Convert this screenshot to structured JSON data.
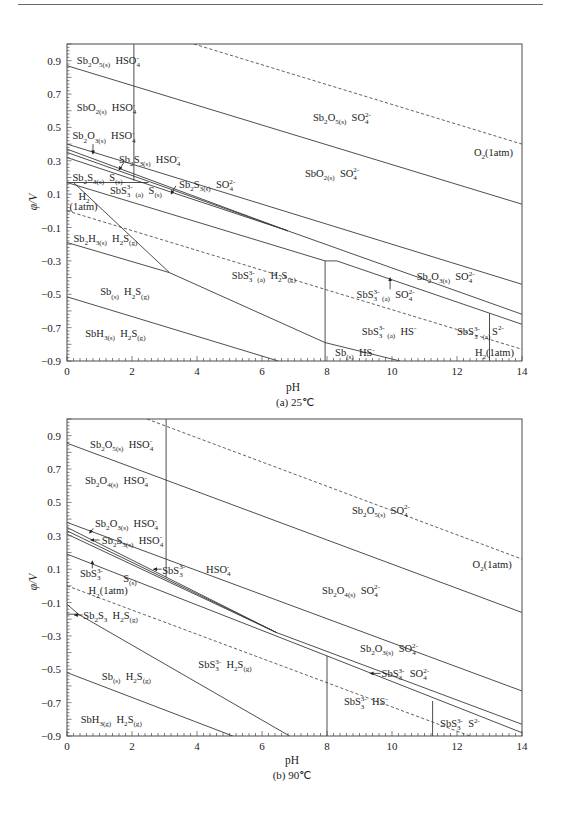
{
  "page": {
    "header_rule": "top page rule"
  },
  "chart_data": [
    {
      "type": "line",
      "title": "(a)  25℃",
      "xlabel": "pH",
      "ylabel": "φ/V",
      "xlim": [
        0,
        14
      ],
      "ylim": [
        -0.9,
        1.0
      ],
      "grid": false,
      "legend": "none (in-plot region labels)",
      "xticks": [
        0,
        2,
        4,
        6,
        8,
        10,
        12,
        14
      ],
      "xtick_labels": [
        "0",
        "2",
        "4",
        "6",
        "8",
        "10",
        "12",
        "14"
      ],
      "yticks": [
        0.9,
        0.7,
        0.5,
        0.3,
        0.1,
        -0.1,
        -0.3,
        -0.5,
        -0.7,
        -0.9
      ],
      "ytick_labels": [
        "0.9",
        "0.7",
        "0.5",
        "0.3",
        "0.1",
        "−0.1",
        "−0.3",
        "−0.5",
        "−0.7",
        "−0.9"
      ],
      "x_minor_step": 0.2,
      "y_minor_step": 0.02,
      "y_major_step": 0.1,
      "series": [
        {
          "name": "O2(1atm) equilibrium",
          "style": "dashed",
          "points": [
            [
              3.9,
              1.0
            ],
            [
              14,
              0.4
            ]
          ]
        },
        {
          "name": "H2(1atm) equilibrium",
          "style": "dashed",
          "points": [
            [
              0,
              0.0
            ],
            [
              14,
              -0.83
            ]
          ]
        },
        {
          "name": "Sb2O5 / SbO2 boundary",
          "style": "solid",
          "points": [
            [
              0,
              0.87
            ],
            [
              14,
              0.04
            ]
          ]
        },
        {
          "name": "HSO4- / SO4 2- boundary",
          "style": "solid",
          "points": [
            [
              2.06,
              1.0
            ],
            [
              2.06,
              0.18
            ]
          ]
        },
        {
          "name": "Sb2S3 / S horizontal",
          "style": "solid",
          "points": [
            [
              0,
              0.17
            ],
            [
              2.5,
              0.17
            ]
          ]
        },
        {
          "name": "SbO2 / Sb2O3 boundary",
          "style": "solid",
          "points": [
            [
              0,
              0.4
            ],
            [
              14,
              -0.44
            ]
          ]
        },
        {
          "name": "boundary b1",
          "style": "solid",
          "points": [
            [
              0,
              0.37
            ],
            [
              6.8,
              -0.12
            ],
            [
              14,
              -0.62
            ]
          ]
        },
        {
          "name": "boundary b2",
          "style": "solid",
          "points": [
            [
              0,
              0.35
            ],
            [
              6.8,
              -0.12
            ]
          ]
        },
        {
          "name": "boundary b3",
          "style": "solid",
          "points": [
            [
              0,
              0.32
            ],
            [
              6.8,
              -0.12
            ]
          ]
        },
        {
          "name": "boundary b4",
          "style": "solid",
          "points": [
            [
              0,
              0.17
            ],
            [
              7.94,
              -0.3
            ],
            [
              8.3,
              -0.3
            ],
            [
              14,
              -0.68
            ]
          ]
        },
        {
          "name": "H2S / HS- boundary (pH 8)",
          "style": "solid",
          "points": [
            [
              7.94,
              -0.3
            ],
            [
              7.94,
              -0.9
            ]
          ]
        },
        {
          "name": "HS- / S2- boundary (pH 13)",
          "style": "solid",
          "points": [
            [
              13,
              -0.615
            ],
            [
              13,
              -0.9
            ]
          ]
        },
        {
          "name": "Sb2S3 / SbS3 3- steep boundary",
          "style": "solid",
          "points": [
            [
              0.2,
              0.17
            ],
            [
              3.15,
              -0.37
            ]
          ]
        },
        {
          "name": "Sb2S3 / Sb boundary",
          "style": "solid",
          "points": [
            [
              0,
              -0.19
            ],
            [
              3.15,
              -0.37
            ],
            [
              7.94,
              -0.79
            ],
            [
              10.25,
              -0.9
            ]
          ]
        },
        {
          "name": "Sb / SbH3 boundary",
          "style": "solid",
          "points": [
            [
              0,
              -0.515
            ],
            [
              6.5,
              -0.9
            ]
          ]
        }
      ],
      "region_labels": [
        {
          "text": "Sb_{2}O_{5(s)}  HSO_{4}^{-}",
          "x": 0.3,
          "y": 0.9
        },
        {
          "text": "SbO_{2(s)}  HSO_{4}^{-}",
          "x": 0.3,
          "y": 0.62
        },
        {
          "text": "Sb_{2}O_{3(s)}  HSO_{4}^{-}",
          "x": 0.17,
          "y": 0.45
        },
        {
          "text": "Sb_{2}S_{3(s)}  HSO_{4}^{-}",
          "x": 1.6,
          "y": 0.31
        },
        {
          "text": "Sb_{2}S_{3(s)}  S_{(s)}",
          "x": 0.17,
          "y": 0.2
        },
        {
          "text": "SbS_{3}^{3-} _{(a)}  S_{(s)}",
          "x": 1.32,
          "y": 0.125
        },
        {
          "text": "Sb_{2}S_{3(s)}  SO_{4}^{2-}",
          "x": 3.45,
          "y": 0.16
        },
        {
          "text": "H_{2}",
          "x": 0.35,
          "y": 0.085
        },
        {
          "text": "(1atm)",
          "x": 0.08,
          "y": 0.025
        },
        {
          "text": "Sb_{2}H_{3(s)}  H_{2}S_{(g)}",
          "x": 0.2,
          "y": -0.165
        },
        {
          "text": "Sb_{(s)}  H_{2}S_{(g)}",
          "x": 1.02,
          "y": -0.485
        },
        {
          "text": "SbH_{3(s)}  H_{2}S_{(g)}",
          "x": 0.56,
          "y": -0.735
        },
        {
          "text": "SbS_{3}^{3-} _{(a)}  H_{2}S_{(g)}",
          "x": 5.07,
          "y": -0.385
        },
        {
          "text": "Sb_{2}O_{5(s)}  SO_{4}^{2-}",
          "x": 7.57,
          "y": 0.56
        },
        {
          "text": "SbO_{2(s)}  SO_{4}^{2-}",
          "x": 7.32,
          "y": 0.227
        },
        {
          "text": "O_{2}(1atm)",
          "x": 12.52,
          "y": 0.353
        },
        {
          "text": "Sb_{2}O_{3(s)}  SO_{4}^{2-}",
          "x": 10.76,
          "y": -0.395
        },
        {
          "text": "SbS_{3}^{3-} _{(a)}  SO_{4}^{2-}",
          "x": 8.91,
          "y": -0.5
        },
        {
          "text": "SbS_{3}^{3-} _{(a)}  HS^{-}",
          "x": 9.07,
          "y": -0.72
        },
        {
          "text": "SbS_{3}^{3-} _{(a)}",
          "x": 12.0,
          "y": -0.725
        },
        {
          "text": "S^{2-}",
          "x": 13.08,
          "y": -0.72
        },
        {
          "text": "Sb_{(s)}  HS^{-}",
          "x": 8.25,
          "y": -0.85
        },
        {
          "text": "H_{2}(1atm)",
          "x": 12.55,
          "y": -0.85
        }
      ],
      "arrows": [
        {
          "from": [
            0.8,
            0.4
          ],
          "to": [
            0.8,
            0.34
          ]
        },
        {
          "from": [
            1.75,
            0.29
          ],
          "to": [
            1.6,
            0.245
          ]
        },
        {
          "from": [
            3.35,
            0.15
          ],
          "to": [
            3.2,
            0.1
          ]
        },
        {
          "from": [
            9.94,
            -0.47
          ],
          "to": [
            9.94,
            -0.4
          ]
        }
      ]
    },
    {
      "type": "line",
      "title": "(b)  90℃",
      "xlabel": "pH",
      "ylabel": "φ/V",
      "xlim": [
        0,
        14
      ],
      "ylim": [
        -0.9,
        1.0
      ],
      "grid": false,
      "legend": "none (in-plot region labels)",
      "xticks": [
        0,
        2,
        4,
        6,
        8,
        10,
        12,
        14
      ],
      "xtick_labels": [
        "0",
        "2",
        "4",
        "6",
        "8",
        "10",
        "12",
        "14"
      ],
      "yticks": [
        0.9,
        0.7,
        0.5,
        0.3,
        0.1,
        -0.1,
        -0.3,
        -0.5,
        -0.7,
        -0.9
      ],
      "ytick_labels": [
        "0.9",
        "0.7",
        "0.5",
        "0.3",
        "0.1",
        "−0.1",
        "−0.3",
        "−0.5",
        "−0.7",
        "−0.9"
      ],
      "x_minor_step": 0.2,
      "y_minor_step": 0.02,
      "y_major_step": 0.1,
      "series": [
        {
          "name": "O2(1atm) equilibrium",
          "style": "dashed",
          "points": [
            [
              2.46,
              1.0
            ],
            [
              14,
              0.16
            ]
          ]
        },
        {
          "name": "H2(1atm) equilibrium",
          "style": "dashed",
          "points": [
            [
              0,
              0.0
            ],
            [
              12.4,
              -0.9
            ]
          ]
        },
        {
          "name": "Sb2O5 / Sb2O4 boundary",
          "style": "solid",
          "points": [
            [
              0,
              0.855
            ],
            [
              14,
              -0.16
            ]
          ]
        },
        {
          "name": "HSO4- / SO4 2- boundary",
          "style": "solid",
          "points": [
            [
              3.05,
              1.0
            ],
            [
              3.05,
              0.05
            ]
          ]
        },
        {
          "name": "Sb2O4 / Sb2O3 boundary",
          "style": "solid",
          "points": [
            [
              0,
              0.38
            ],
            [
              14,
              -0.63
            ]
          ]
        },
        {
          "name": "boundary c1",
          "style": "solid",
          "points": [
            [
              0,
              0.35
            ],
            [
              6.45,
              -0.28
            ],
            [
              14,
              -0.83
            ]
          ]
        },
        {
          "name": "boundary c2",
          "style": "solid",
          "points": [
            [
              0,
              0.33
            ],
            [
              6.45,
              -0.28
            ]
          ]
        },
        {
          "name": "boundary c3",
          "style": "solid",
          "points": [
            [
              0,
              0.31
            ],
            [
              6.45,
              -0.28
            ]
          ]
        },
        {
          "name": "boundary c4",
          "style": "solid",
          "points": [
            [
              0,
              0.19
            ],
            [
              8,
              -0.42
            ],
            [
              14,
              -0.88
            ]
          ]
        },
        {
          "name": "H2S / HS- boundary (pH 8)",
          "style": "solid",
          "points": [
            [
              8,
              -0.42
            ],
            [
              8,
              -0.9
            ]
          ]
        },
        {
          "name": "HS- / S2- boundary (pH 11.25)",
          "style": "solid",
          "points": [
            [
              11.25,
              -0.69
            ],
            [
              11.25,
              -0.9
            ]
          ]
        },
        {
          "name": "SbS3 3- / Sb boundary",
          "style": "solid",
          "points": [
            [
              0,
              -0.11
            ],
            [
              0.35,
              -0.17
            ],
            [
              6.85,
              -0.9
            ]
          ]
        },
        {
          "name": "Sb2S3 small boundary",
          "style": "solid",
          "points": [
            [
              0,
              -0.17
            ],
            [
              0.35,
              -0.17
            ]
          ]
        },
        {
          "name": "Sb / SbH3 boundary",
          "style": "solid",
          "points": [
            [
              0,
              -0.52
            ],
            [
              5.1,
              -0.9
            ]
          ]
        }
      ],
      "region_labels": [
        {
          "text": "Sb_{2}O_{5(s)}  HSO_{4}^{-}",
          "x": 0.71,
          "y": 0.85
        },
        {
          "text": "Sb_{2}O_{4(s)}  HSO_{4}^{-}",
          "x": 0.55,
          "y": 0.63
        },
        {
          "text": "Sb_{2}O_{5(s)}  SO_{4}^{2-}",
          "x": 8.77,
          "y": 0.455
        },
        {
          "text": "O_{2}(1atm)",
          "x": 12.48,
          "y": 0.13
        },
        {
          "text": "Sb_{2}O_{4(s)}  SO_{4}^{2-}",
          "x": 7.85,
          "y": -0.025
        },
        {
          "text": "Sb_{2}O_{3(s)}  HSO_{4}^{-}",
          "x": 0.86,
          "y": 0.375
        },
        {
          "text": "Sb_{2}S_{3(s)}  HSO_{4}^{-}",
          "x": 1.07,
          "y": 0.275
        },
        {
          "text": "SbS_{3}^{3-}",
          "x": 0.4,
          "y": 0.075
        },
        {
          "text": "S_{(s)}",
          "x": 1.73,
          "y": 0.045
        },
        {
          "text": "SbS_{3}^{3-}",
          "x": 2.93,
          "y": 0.095
        },
        {
          "text": "HSO_{4}^{-}",
          "x": 4.28,
          "y": 0.1
        },
        {
          "text": "H_{2}(1atm)",
          "x": 0.66,
          "y": -0.03
        },
        {
          "text": "Sb_{2}S_{3}  H_{2}S_{(g)}",
          "x": 0.5,
          "y": -0.175
        },
        {
          "text": "SbS_{3}^{3-}  H_{2}S_{(g)}",
          "x": 4.04,
          "y": -0.47
        },
        {
          "text": "Sb_{(s)}  H_{2}S_{(g)}",
          "x": 1.07,
          "y": -0.54
        },
        {
          "text": "SbH_{3(g)}  H_{2}S_{(g)}",
          "x": 0.42,
          "y": -0.8
        },
        {
          "text": "Sb_{2}O_{3(s)}  SO_{4}^{2-}",
          "x": 9.02,
          "y": -0.375
        },
        {
          "text": "SbS_{3}^{3-}  SO_{4}^{2-}",
          "x": 9.68,
          "y": -0.525
        },
        {
          "text": "SbS_{3}^{3-}  HS^{-}",
          "x": 8.52,
          "y": -0.695
        },
        {
          "text": "SbS_{3}^{3-}  S^{2-}",
          "x": 11.48,
          "y": -0.825
        }
      ],
      "arrows": [
        {
          "from": [
            0.81,
            0.345
          ],
          "to": [
            0.69,
            0.315
          ]
        },
        {
          "from": [
            1.0,
            0.275
          ],
          "to": [
            0.73,
            0.275
          ]
        },
        {
          "from": [
            0.78,
            0.105
          ],
          "to": [
            0.78,
            0.15
          ]
        },
        {
          "from": [
            2.91,
            0.1
          ],
          "to": [
            2.66,
            0.1
          ]
        },
        {
          "from": [
            0.48,
            -0.175
          ],
          "to": [
            0.22,
            -0.175
          ]
        },
        {
          "from": [
            9.65,
            -0.525
          ],
          "to": [
            9.32,
            -0.525
          ]
        }
      ]
    }
  ]
}
